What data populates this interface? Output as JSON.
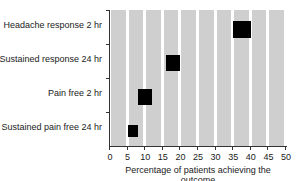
{
  "chart_data": {
    "type": "scatter",
    "title": "",
    "xlabel": "Percentage of patients achieving the outcome",
    "ylabel": "",
    "xlim": [
      0,
      50
    ],
    "x_ticks": [
      "0",
      "5",
      "10",
      "15",
      "20",
      "25",
      "30",
      "35",
      "40",
      "45",
      "50"
    ],
    "grid": "vertical bands every 5%",
    "categories": [
      "Headache response 2 hr",
      "Sustained response 24 hr",
      "Pain free 2 hr",
      "Sustained pain free 24 hr"
    ],
    "series": [
      {
        "name": "Percentage of patients",
        "marker": "filled square (range box)",
        "points": [
          {
            "category": "Headache response 2 hr",
            "low": 35,
            "high": 40,
            "value": 37.5
          },
          {
            "category": "Sustained response 24 hr",
            "low": 16,
            "high": 20,
            "value": 18
          },
          {
            "category": "Pain free 2 hr",
            "low": 8,
            "high": 12,
            "value": 10
          },
          {
            "category": "Sustained pain free 24 hr",
            "low": 5,
            "high": 8,
            "value": 6.5
          }
        ]
      }
    ],
    "colors": {
      "band": "#cfcfcf",
      "marker": "#000000",
      "axis": "#333333"
    }
  }
}
